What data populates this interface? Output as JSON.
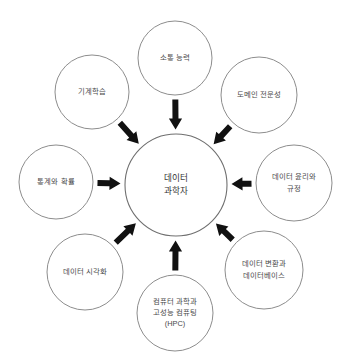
{
  "diagram": {
    "type": "hub-and-spoke",
    "title_visible": false,
    "background_color": "#ffffff",
    "circle_stroke_color": "#8d8d8d",
    "arrow_color": "#111111",
    "label_color": "#4a4a4a",
    "center": {
      "name": "data-scientist",
      "lines": [
        "데이터",
        "과학자"
      ],
      "cx": 176,
      "cy": 185,
      "r": 51
    },
    "nodes": [
      {
        "name": "communication-skills",
        "lines": [
          "소통 능력"
        ],
        "cx": 175,
        "cy": 58,
        "r": 37,
        "position": "top"
      },
      {
        "name": "machine-learning",
        "lines": [
          "기계학습"
        ],
        "cx": 92,
        "cy": 92,
        "r": 37,
        "position": "top-left"
      },
      {
        "name": "domain-expertise",
        "lines": [
          "도메인 전문성"
        ],
        "cx": 259,
        "cy": 95,
        "r": 38,
        "position": "top-right"
      },
      {
        "name": "statistics-and-probability",
        "lines": [
          "통계와 확률"
        ],
        "cx": 56,
        "cy": 182,
        "r": 37,
        "position": "left"
      },
      {
        "name": "data-ethics-and-regulation",
        "lines": [
          "데이터 윤리와",
          "규정"
        ],
        "cx": 294,
        "cy": 183,
        "r": 38,
        "position": "right"
      },
      {
        "name": "data-visualization",
        "lines": [
          "데이터 시각화"
        ],
        "cx": 85,
        "cy": 272,
        "r": 38,
        "position": "bottom-left"
      },
      {
        "name": "computer-science-and-hpc",
        "lines": [
          "컴퓨터 과학과",
          "고성능 컴퓨팅",
          "(HPC)"
        ],
        "cx": 175,
        "cy": 313,
        "r": 38,
        "position": "bottom"
      },
      {
        "name": "data-transformation-and-databases",
        "lines": [
          "데이터 변환과",
          "데이터베이스"
        ],
        "cx": 264,
        "cy": 270,
        "r": 39,
        "position": "bottom-right"
      }
    ],
    "arrows": [
      {
        "name": "arrow-from-communication-skills",
        "from": "communication-skills",
        "to": "data-scientist",
        "angle_deg": 90
      },
      {
        "name": "arrow-from-machine-learning",
        "from": "machine-learning",
        "to": "data-scientist",
        "angle_deg": 48
      },
      {
        "name": "arrow-from-domain-expertise",
        "from": "domain-expertise",
        "to": "data-scientist",
        "angle_deg": 132
      },
      {
        "name": "arrow-from-statistics-and-probability",
        "from": "statistics-and-probability",
        "to": "data-scientist",
        "angle_deg": 0
      },
      {
        "name": "arrow-from-data-ethics-and-regulation",
        "from": "data-ethics-and-regulation",
        "to": "data-scientist",
        "angle_deg": 180
      },
      {
        "name": "arrow-from-data-visualization",
        "from": "data-visualization",
        "to": "data-scientist",
        "angle_deg": 312
      },
      {
        "name": "arrow-from-computer-science-and-hpc",
        "from": "computer-science-and-hpc",
        "to": "data-scientist",
        "angle_deg": 270
      },
      {
        "name": "arrow-from-data-transformation-and-databases",
        "from": "data-transformation-and-databases",
        "to": "data-scientist",
        "angle_deg": 228
      }
    ]
  }
}
